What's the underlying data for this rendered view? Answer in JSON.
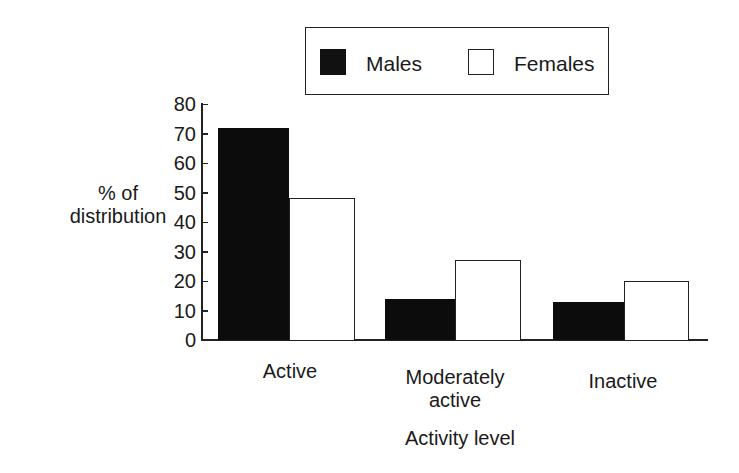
{
  "chart_data": {
    "type": "bar",
    "title": "",
    "xlabel": "Activity level",
    "ylabel": "% of distribution",
    "ylim": [
      0,
      80
    ],
    "yticks": [
      0,
      10,
      20,
      30,
      40,
      50,
      60,
      70,
      80
    ],
    "categories": [
      "Active",
      "Moderately active",
      "Inactive"
    ],
    "series": [
      {
        "name": "Males",
        "color": "#111111",
        "values": [
          72,
          14,
          13
        ]
      },
      {
        "name": "Females",
        "color": "#ffffff",
        "values": [
          48,
          27,
          20
        ]
      }
    ],
    "legend_position": "top-right",
    "grid": false
  },
  "legend": {
    "males": "Males",
    "females": "Females"
  },
  "axis": {
    "ylabel_line1": "% of",
    "ylabel_line2": "distribution",
    "xlabel": "Activity level",
    "yticks": [
      "0",
      "10",
      "20",
      "30",
      "40",
      "50",
      "60",
      "70",
      "80"
    ],
    "cat1": "Active",
    "cat2_line1": "Moderately",
    "cat2_line2": "active",
    "cat3": "Inactive"
  }
}
